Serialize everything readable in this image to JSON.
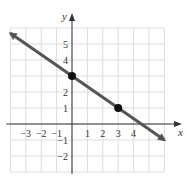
{
  "chart_data": {
    "type": "line",
    "title": "",
    "xlabel": "x",
    "ylabel": "y",
    "xlim": [
      -4,
      6
    ],
    "ylim": [
      -3,
      6
    ],
    "grid": true,
    "x_ticks": [
      -3,
      -2,
      -1,
      1,
      2,
      3,
      4
    ],
    "y_ticks": [
      -2,
      -1,
      1,
      2,
      4,
      5
    ],
    "x_tick_labels": [
      "−3",
      "−2",
      "−1",
      "1",
      "2",
      "3",
      "4"
    ],
    "y_tick_labels": [
      "−2",
      "−1",
      "1",
      "2",
      "4",
      "5"
    ],
    "series": [
      {
        "name": "line",
        "equation": "y = -2/3 x + 3",
        "slope": -0.6667,
        "intercept": 3,
        "x": [
          -4,
          6
        ],
        "y": [
          5.67,
          -1
        ],
        "arrows": "both"
      }
    ],
    "points": [
      {
        "x": 0,
        "y": 3
      },
      {
        "x": 3,
        "y": 1
      }
    ],
    "colors": {
      "line": "#555555",
      "grid": "#dddddd",
      "axis": "#333333",
      "point": "#111111"
    }
  }
}
